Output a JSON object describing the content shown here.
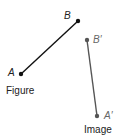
{
  "figure": {
    "caption": "Figure",
    "points": [
      {
        "label": "A",
        "x": 21,
        "y": 74
      },
      {
        "label": "B",
        "x": 78,
        "y": 21
      }
    ],
    "color": "#111111"
  },
  "image": {
    "caption": "Image",
    "points": [
      {
        "label": "B′",
        "x": 87,
        "y": 40
      },
      {
        "label": "A′",
        "x": 97,
        "y": 116
      }
    ],
    "color": "#555555"
  }
}
